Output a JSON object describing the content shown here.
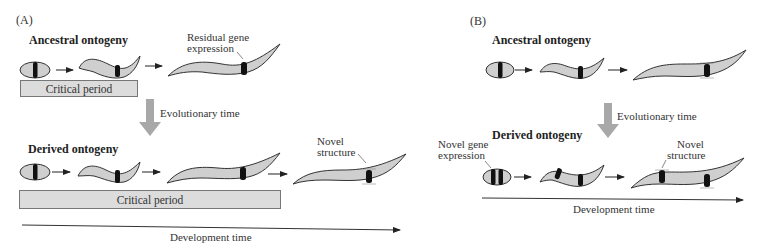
{
  "panel_a": {
    "label": "(A)",
    "ancestral": {
      "heading": "Ancestral ontogeny",
      "annotation": "Residual gene expression",
      "annotation_lines": [
        "Residual gene",
        "expression"
      ],
      "stages": [
        "embryo",
        "larva",
        "adult"
      ]
    },
    "evolutionary_time_label": "Evolutionary time",
    "derived": {
      "heading": "Derived ontogeny",
      "annotation": "Novel structure",
      "annotation_lines": [
        "Novel",
        "structure"
      ],
      "stages": [
        "embryo",
        "larva",
        "juvenile",
        "adult"
      ]
    },
    "critical_period_label": "Critical period",
    "development_time_label": "Development time"
  },
  "panel_b": {
    "label": "(B)",
    "ancestral": {
      "heading": "Ancestral ontogeny",
      "stages": [
        "embryo",
        "larva",
        "adult"
      ]
    },
    "evolutionary_time_label": "Evolutionary time",
    "derived": {
      "heading": "Derived ontogeny",
      "annotation_gene": "Novel gene expression",
      "annotation_gene_lines": [
        "Novel gene",
        "expression"
      ],
      "annotation_structure": "Novel structure",
      "annotation_structure_lines": [
        "Novel",
        "structure"
      ],
      "stages": [
        "embryo",
        "larva",
        "adult"
      ]
    },
    "development_time_label": "Development time"
  },
  "colors": {
    "body_fill": "#cfcfcf",
    "outline": "#333333",
    "band": "#111111",
    "critical_box": "#dcdcdc",
    "evo_arrow": "#a8a8a8"
  }
}
